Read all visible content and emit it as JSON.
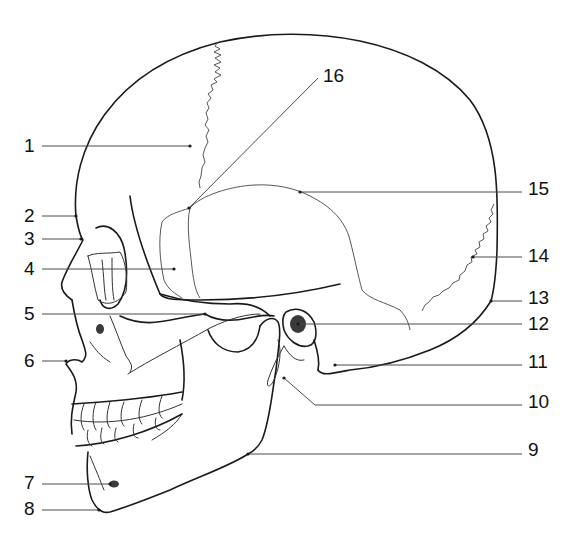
{
  "diagram": {
    "colors": {
      "line": "#1a1a1a",
      "leader": "#4a4a4a",
      "background": "#ffffff",
      "foramen_fill": "#3a3a3a"
    },
    "labels": [
      {
        "id": "1",
        "text": "1",
        "tx": 24,
        "ty": 152,
        "line": [
          42,
          146,
          190,
          146
        ]
      },
      {
        "id": "2",
        "text": "2",
        "tx": 24,
        "ty": 222,
        "line": [
          42,
          216,
          76,
          216
        ]
      },
      {
        "id": "3",
        "text": "3",
        "tx": 24,
        "ty": 245,
        "line": [
          42,
          239,
          81,
          239
        ]
      },
      {
        "id": "4",
        "text": "4",
        "tx": 24,
        "ty": 275,
        "line": [
          42,
          269,
          174,
          269
        ]
      },
      {
        "id": "5",
        "text": "5",
        "tx": 24,
        "ty": 320,
        "line": [
          42,
          314,
          205,
          314
        ]
      },
      {
        "id": "6",
        "text": "6",
        "tx": 24,
        "ty": 367,
        "line": [
          42,
          361,
          66,
          361
        ]
      },
      {
        "id": "7",
        "text": "7",
        "tx": 24,
        "ty": 489,
        "line": [
          42,
          484,
          110,
          484
        ]
      },
      {
        "id": "8",
        "text": "8",
        "tx": 24,
        "ty": 515,
        "line": [
          42,
          510,
          99,
          510
        ]
      },
      {
        "id": "9",
        "text": "9",
        "tx": 528,
        "ty": 456,
        "line": [
          248,
          454,
          522,
          454
        ]
      },
      {
        "id": "10",
        "text": "10",
        "tx": 528,
        "ty": 408,
        "line": [
          284,
          378,
          315,
          405,
          522,
          405
        ]
      },
      {
        "id": "11",
        "text": "11",
        "tx": 528,
        "ty": 368,
        "line": [
          335,
          365,
          522,
          365
        ]
      },
      {
        "id": "12",
        "text": "12",
        "tx": 528,
        "ty": 330,
        "line": [
          298,
          324,
          522,
          324
        ]
      },
      {
        "id": "13",
        "text": "13",
        "tx": 528,
        "ty": 304,
        "line": [
          491,
          301,
          522,
          301
        ]
      },
      {
        "id": "14",
        "text": "14",
        "tx": 528,
        "ty": 262,
        "line": [
          473,
          257,
          522,
          257
        ]
      },
      {
        "id": "15",
        "text": "15",
        "tx": 528,
        "ty": 195,
        "line": [
          300,
          192,
          522,
          192
        ]
      },
      {
        "id": "16",
        "text": "16",
        "tx": 323,
        "ty": 82,
        "line": [
          189,
          208,
          318,
          78
        ]
      }
    ]
  }
}
